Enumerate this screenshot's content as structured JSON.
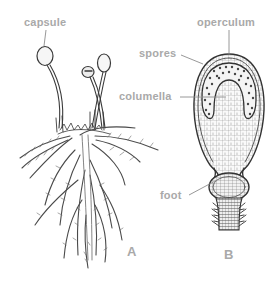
{
  "figure": {
    "panels": [
      {
        "id": "A",
        "letter": "A",
        "subject": "moss plant with sporophytes",
        "labels": [
          {
            "key": "capsule",
            "text": "capsule"
          }
        ]
      },
      {
        "id": "B",
        "letter": "B",
        "subject": "longitudinal section of sporophyte",
        "labels": [
          {
            "key": "operculum",
            "text": "operculum"
          },
          {
            "key": "spores",
            "text": "spores"
          },
          {
            "key": "columella",
            "text": "columella"
          },
          {
            "key": "foot",
            "text": "foot"
          }
        ]
      }
    ],
    "colors": {
      "label": "#a9a9a9",
      "ink": "#3a3a3a",
      "background": "#ffffff"
    }
  }
}
